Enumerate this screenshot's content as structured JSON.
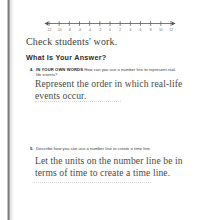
{
  "page": {
    "background_color": "#ffffff",
    "text_color": "#3d3d3d",
    "answer_ink_color": "#4a4a4a",
    "scan_edge_color": "#6e6e6e"
  },
  "numberline": {
    "label": "number-line-graphic",
    "min": -12,
    "max": 12,
    "step": 2,
    "tick_labels": [
      "-12",
      "-10",
      "-8",
      "-6",
      "-4",
      "-2",
      "0",
      "2",
      "4",
      "6",
      "8",
      "10",
      "12"
    ],
    "arrow_left": true,
    "arrow_right": true,
    "line_color": "#555555"
  },
  "check_note": {
    "text": "Check students' work."
  },
  "section": {
    "heading": "What Is Your Answer?"
  },
  "questions": [
    {
      "number": "4.",
      "lead_in": "IN YOUR OWN WORDS",
      "prompt": "How can you use a number line to represent real-life events?",
      "answer": "Represent the order in which real-life events occur."
    },
    {
      "number": "5.",
      "lead_in": "",
      "prompt": "Describe how you can use a number line to create a time line.",
      "answer": "Let the units on the number line be in terms of time to create a time line."
    }
  ]
}
